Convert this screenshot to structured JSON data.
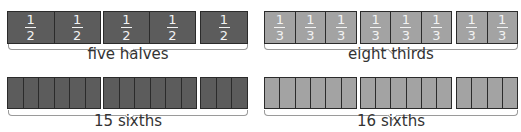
{
  "colors": {
    "dark_fill": "#5c5c5c",
    "light_fill": "#a3a3a3",
    "border": "#2b2b2b",
    "fraction_text": "#f2f2f2",
    "label_text": "#333333"
  },
  "panels": [
    {
      "id": "five-halves",
      "label": "five halves",
      "fill": "dark",
      "groups": [
        {
          "cells": 2,
          "x": 7,
          "w": 94
        },
        {
          "cells": 2,
          "x": 103,
          "w": 93
        },
        {
          "cells": 1,
          "x": 200,
          "w": 48
        }
      ],
      "fraction": {
        "numerator": "1",
        "denominator": "2"
      },
      "y": 11,
      "h": 33
    },
    {
      "id": "eight-thirds",
      "label": "eight thirds",
      "fill": "light",
      "groups": [
        {
          "cells": 3,
          "x": 264,
          "w": 93
        },
        {
          "cells": 3,
          "x": 360,
          "w": 92
        },
        {
          "cells": 2,
          "x": 456,
          "w": 62
        }
      ],
      "fraction": {
        "numerator": "1",
        "denominator": "3"
      },
      "y": 11,
      "h": 33
    },
    {
      "id": "fifteen-sixths",
      "label": "15 sixths",
      "fill": "dark",
      "groups": [
        {
          "cells": 6,
          "x": 7,
          "w": 94
        },
        {
          "cells": 6,
          "x": 103,
          "w": 94
        },
        {
          "cells": 3,
          "x": 200,
          "w": 48
        }
      ],
      "y": 77,
      "h": 32
    },
    {
      "id": "sixteen-sixths",
      "label": "16 sixths",
      "fill": "light",
      "groups": [
        {
          "cells": 6,
          "x": 264,
          "w": 93
        },
        {
          "cells": 6,
          "x": 360,
          "w": 92
        },
        {
          "cells": 4,
          "x": 456,
          "w": 62
        }
      ],
      "y": 77,
      "h": 32
    }
  ],
  "labels": {
    "five_halves": "five halves",
    "eight_thirds": "eight thirds",
    "fifteen_sixths": "15 sixths",
    "sixteen_sixths": "16 sixths"
  },
  "fractions": {
    "half": {
      "numerator": "1",
      "denominator": "2"
    },
    "third": {
      "numerator": "1",
      "denominator": "3"
    }
  }
}
